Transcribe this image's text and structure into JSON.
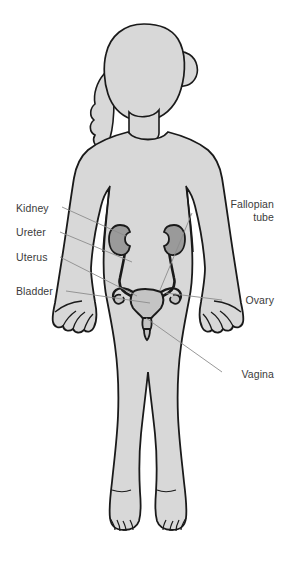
{
  "diagram": {
    "background_color": "#ffffff",
    "body_fill": "#d8d8d8",
    "body_stroke": "#1a1a1a",
    "organ_fill": "#9a9a9a",
    "organ_light_fill": "#c4c4c4",
    "organ_stroke": "#1a1a1a",
    "leader_color": "#8c8c8c",
    "label_color": "#3b3b3b"
  },
  "labels": [
    {
      "id": "kidney",
      "text": "Kidney",
      "side": "left",
      "x": 16,
      "y": 202,
      "width": 70
    },
    {
      "id": "ureter",
      "text": "Ureter",
      "side": "left",
      "x": 16,
      "y": 226,
      "width": 70
    },
    {
      "id": "uterus",
      "text": "Uterus",
      "side": "left",
      "x": 16,
      "y": 251,
      "width": 70
    },
    {
      "id": "bladder",
      "text": "Bladder",
      "side": "left",
      "x": 16,
      "y": 285,
      "width": 70
    },
    {
      "id": "fallopian-tube",
      "text": "Fallopian\ntube",
      "side": "right",
      "x": 196,
      "y": 198,
      "width": 78
    },
    {
      "id": "ovary",
      "text": "Ovary",
      "side": "right",
      "x": 196,
      "y": 294,
      "width": 78
    },
    {
      "id": "vagina",
      "text": "Vagina",
      "side": "right",
      "x": 196,
      "y": 368,
      "width": 78
    }
  ],
  "leaders": [
    {
      "id": "leader-kidney",
      "x1": 62,
      "y1": 207,
      "x2": 126,
      "y2": 236
    },
    {
      "id": "leader-ureter",
      "x1": 60,
      "y1": 232,
      "x2": 132,
      "y2": 262
    },
    {
      "id": "leader-uterus",
      "x1": 60,
      "y1": 257,
      "x2": 137,
      "y2": 296
    },
    {
      "id": "leader-bladder",
      "x1": 66,
      "y1": 291,
      "x2": 150,
      "y2": 303
    },
    {
      "id": "leader-fallopian-tube",
      "x1": 192,
      "y1": 213,
      "x2": 160,
      "y2": 290
    },
    {
      "id": "leader-ovary",
      "x1": 222,
      "y1": 300,
      "x2": 166,
      "y2": 293
    },
    {
      "id": "leader-vagina",
      "x1": 222,
      "y1": 372,
      "x2": 146,
      "y2": 318
    }
  ],
  "organs": [
    {
      "id": "kidney-left",
      "name": "kidney"
    },
    {
      "id": "kidney-right",
      "name": "kidney"
    },
    {
      "id": "ureter-left",
      "name": "ureter"
    },
    {
      "id": "ureter-right",
      "name": "ureter"
    },
    {
      "id": "uterus-body",
      "name": "uterus"
    },
    {
      "id": "fallopian-tube-left",
      "name": "fallopian tube"
    },
    {
      "id": "fallopian-tube-right",
      "name": "fallopian tube"
    },
    {
      "id": "ovary-left",
      "name": "ovary"
    },
    {
      "id": "ovary-right",
      "name": "ovary"
    },
    {
      "id": "vagina",
      "name": "vagina"
    }
  ]
}
